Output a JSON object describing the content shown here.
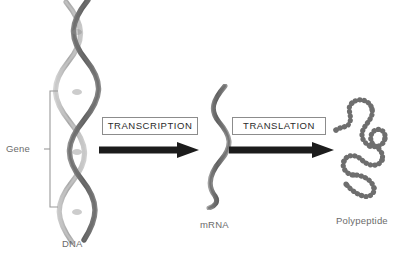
{
  "diagram": {
    "background_color": "#ffffff"
  },
  "labels": {
    "gene": "Gene",
    "dna": "DNA",
    "mrna": "mRNA",
    "polypeptide": "Polypeptide"
  },
  "processes": {
    "transcription": "TRANSCRIPTION",
    "translation": "TRANSLATION"
  },
  "icons": {
    "dna_helix": "dna-double-helix-icon",
    "mrna_strand": "mrna-single-strand-icon",
    "polypeptide_chain": "polypeptide-bead-chain-icon",
    "arrow_right": "arrow-right-icon",
    "gene_bracket": "gene-bracket-icon"
  },
  "colors": {
    "label_text": "#6b6b6b",
    "process_text": "#2b2b2b",
    "process_box_border": "#8c8c8c",
    "arrow": "#1c1c1c",
    "helix_light": "#b9b9b9",
    "helix_dark": "#7b7b7b",
    "polypeptide_bead": "#6e6e6e",
    "bracket": "#9a9a9a"
  }
}
